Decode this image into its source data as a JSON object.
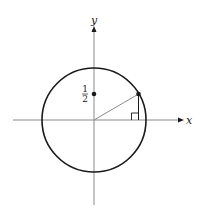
{
  "diagram": {
    "axes": {
      "x_label": "x",
      "y_label": "y",
      "axis_color": "#8a8a8a"
    },
    "circle": {
      "stroke_color": "#1a1a1a"
    },
    "point_on_y_axis": {
      "label_numerator": "1",
      "label_denominator": "2"
    },
    "radius_segment": {
      "color": "#8a8a8a"
    },
    "right_angle_marker": {
      "present": true
    }
  }
}
